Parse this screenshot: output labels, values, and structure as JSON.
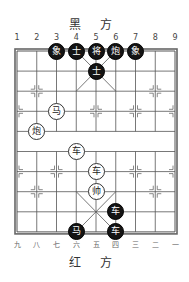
{
  "labels": {
    "top_side": "黑 方",
    "bottom_side": "红 方",
    "top_files": [
      "1",
      "2",
      "3",
      "4",
      "5",
      "6",
      "7",
      "8",
      "9"
    ],
    "bottom_files": [
      "九",
      "八",
      "七",
      "六",
      "五",
      "四",
      "三",
      "二",
      "一"
    ]
  },
  "board": {
    "files": 9,
    "ranks": 10,
    "line_color": "#555555",
    "border_color": "#666666"
  },
  "pieces": [
    {
      "side": "black",
      "char": "象",
      "file": 2,
      "rank": 0
    },
    {
      "side": "black",
      "char": "士",
      "file": 3,
      "rank": 0
    },
    {
      "side": "black",
      "char": "将",
      "file": 4,
      "rank": 0
    },
    {
      "side": "black",
      "char": "炮",
      "file": 5,
      "rank": 0
    },
    {
      "side": "black",
      "char": "象",
      "file": 6,
      "rank": 0
    },
    {
      "side": "black",
      "char": "士",
      "file": 4,
      "rank": 1
    },
    {
      "side": "red",
      "char": "马",
      "file": 2,
      "rank": 3
    },
    {
      "side": "red",
      "char": "炮",
      "file": 1,
      "rank": 4
    },
    {
      "side": "red",
      "char": "车",
      "file": 3,
      "rank": 5
    },
    {
      "side": "red",
      "char": "车",
      "file": 4,
      "rank": 6
    },
    {
      "side": "red",
      "char": "帅",
      "file": 4,
      "rank": 7
    },
    {
      "side": "black",
      "char": "车",
      "file": 5,
      "rank": 8
    },
    {
      "side": "black",
      "char": "马",
      "file": 3,
      "rank": 9
    },
    {
      "side": "black",
      "char": "车",
      "file": 5,
      "rank": 9
    }
  ]
}
